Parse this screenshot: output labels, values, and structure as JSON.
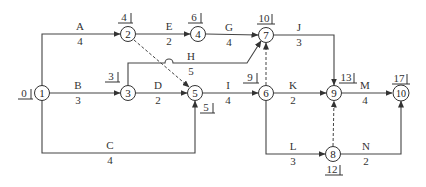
{
  "diagram": {
    "type": "activity-on-arrow network",
    "nodes": [
      {
        "id": "1",
        "label": "1",
        "x": 42,
        "y": 93,
        "time": "0"
      },
      {
        "id": "2",
        "label": "2",
        "x": 128,
        "y": 34,
        "time": "4"
      },
      {
        "id": "3",
        "label": "3",
        "x": 128,
        "y": 93,
        "time": "3"
      },
      {
        "id": "4",
        "label": "4",
        "x": 198,
        "y": 34,
        "time": "6"
      },
      {
        "id": "5",
        "label": "5",
        "x": 195,
        "y": 93,
        "time": "5"
      },
      {
        "id": "6",
        "label": "6",
        "x": 266,
        "y": 93,
        "time": "9"
      },
      {
        "id": "7",
        "label": "7",
        "x": 266,
        "y": 35,
        "time": "10"
      },
      {
        "id": "8",
        "label": "8",
        "x": 333,
        "y": 154,
        "time": "12"
      },
      {
        "id": "9",
        "label": "9",
        "x": 334,
        "y": 93,
        "time": "13"
      },
      {
        "id": "10",
        "label": "10",
        "x": 401,
        "y": 93,
        "time": "17"
      }
    ],
    "activities": [
      {
        "name": "A",
        "duration": "4",
        "from": "1",
        "to": "2"
      },
      {
        "name": "B",
        "duration": "3",
        "from": "1",
        "to": "3"
      },
      {
        "name": "C",
        "duration": "4",
        "from": "1",
        "to": "5"
      },
      {
        "name": "D",
        "duration": "2",
        "from": "3",
        "to": "5"
      },
      {
        "name": "E",
        "duration": "2",
        "from": "2",
        "to": "4"
      },
      {
        "name": "G",
        "duration": "4",
        "from": "4",
        "to": "7"
      },
      {
        "name": "H",
        "duration": "5",
        "from": "3",
        "to": "7"
      },
      {
        "name": "I",
        "duration": "4",
        "from": "5",
        "to": "6"
      },
      {
        "name": "J",
        "duration": "3",
        "from": "7",
        "to": "9"
      },
      {
        "name": "K",
        "duration": "2",
        "from": "6",
        "to": "9"
      },
      {
        "name": "L",
        "duration": "3",
        "from": "6",
        "to": "8"
      },
      {
        "name": "M",
        "duration": "4",
        "from": "9",
        "to": "10"
      },
      {
        "name": "N",
        "duration": "2",
        "from": "8",
        "to": "10"
      }
    ],
    "dummies": [
      {
        "from": "2",
        "to": "5"
      },
      {
        "from": "6",
        "to": "7"
      },
      {
        "from": "8",
        "to": "9"
      }
    ]
  }
}
